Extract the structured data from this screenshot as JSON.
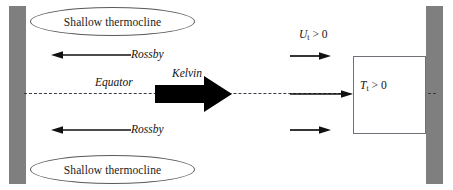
{
  "diagram": {
    "type": "diagram",
    "width": 453,
    "height": 190,
    "background": "#ffffff",
    "colors": {
      "wall": "#7f7f7f",
      "equator_line": "#3a3a4a",
      "ellipse_stroke": "#5a5a5a",
      "box_stroke": "#707078",
      "arrow": "#111111",
      "kelvin_arrow": "#000000",
      "text": "#141414"
    },
    "walls": {
      "left_label": "western-boundary",
      "right_label": "eastern-boundary"
    },
    "equator": {
      "label": "Equator",
      "style": "dashed"
    },
    "ellipses": [
      {
        "label": "Shallow thermocline",
        "position": "north"
      },
      {
        "label": "Shallow thermocline",
        "position": "south"
      }
    ],
    "rossby": [
      {
        "label": "Rossby",
        "direction": "west",
        "position": "north"
      },
      {
        "label": "Rossby",
        "direction": "west",
        "position": "south"
      }
    ],
    "kelvin": {
      "label": "Kelvin",
      "direction": "east"
    },
    "zonal_current": {
      "symbol": "U",
      "subscript": "t",
      "relation": "> 0",
      "label": "U_t > 0",
      "arrow_count": 3,
      "direction": "east"
    },
    "temperature_box": {
      "symbol": "T",
      "subscript": "t",
      "relation": "> 0",
      "label": "T_t > 0",
      "region": "eastern-equatorial-pacific"
    }
  }
}
